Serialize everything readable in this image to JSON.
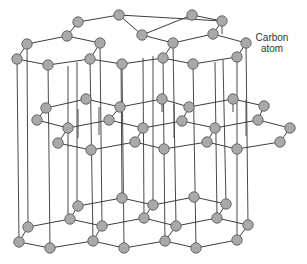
{
  "diagram": {
    "label": {
      "line1": "Carbon",
      "line2": "atom"
    },
    "colors": {
      "atom_fill": "#a9a9a9",
      "atom_stroke": "#5e5e5e",
      "bond": "#3d3d3d",
      "background": "#ffffff"
    },
    "atom_radius": 5.2,
    "layers": [
      {
        "name": "top",
        "atoms": [
          [
            78,
            22
          ],
          [
            119,
            15
          ],
          [
            192,
            15
          ],
          [
            222,
            21
          ],
          [
            67,
            36
          ],
          [
            142,
            35
          ],
          [
            213,
            34
          ],
          [
            27,
            44
          ],
          [
            100,
            43
          ],
          [
            173,
            43
          ],
          [
            246,
            43
          ],
          [
            17,
            59
          ],
          [
            48,
            65
          ],
          [
            90,
            59
          ],
          [
            122,
            64
          ],
          [
            163,
            58
          ],
          [
            193,
            64
          ],
          [
            237,
            57
          ]
        ],
        "bonds": [
          [
            0,
            1
          ],
          [
            1,
            3
          ],
          [
            1,
            5
          ],
          [
            0,
            4
          ],
          [
            2,
            3
          ],
          [
            2,
            5
          ],
          [
            3,
            6
          ],
          [
            4,
            7
          ],
          [
            4,
            8
          ],
          [
            5,
            9
          ],
          [
            6,
            9
          ],
          [
            6,
            10
          ],
          [
            7,
            11
          ],
          [
            11,
            12
          ],
          [
            12,
            13
          ],
          [
            8,
            13
          ],
          [
            13,
            14
          ],
          [
            14,
            15
          ],
          [
            9,
            15
          ],
          [
            15,
            16
          ],
          [
            16,
            17
          ],
          [
            10,
            17
          ]
        ]
      },
      {
        "name": "middle",
        "atoms": [
          [
            86,
            99
          ],
          [
            46,
            108
          ],
          [
            120,
            107
          ],
          [
            162,
            99
          ],
          [
            37,
            120
          ],
          [
            109,
            120
          ],
          [
            68,
            128
          ],
          [
            143,
            128
          ],
          [
            58,
            143
          ],
          [
            135,
            142
          ],
          [
            91,
            150
          ],
          [
            164,
            149
          ],
          [
            189,
            107
          ],
          [
            233,
            99
          ],
          [
            264,
            106
          ],
          [
            182,
            121
          ],
          [
            258,
            120
          ],
          [
            215,
            128
          ],
          [
            290,
            128
          ],
          [
            207,
            142
          ],
          [
            280,
            142
          ],
          [
            237,
            149
          ]
        ],
        "bonds": [
          [
            0,
            1
          ],
          [
            0,
            2
          ],
          [
            2,
            3
          ],
          [
            1,
            4
          ],
          [
            4,
            6
          ],
          [
            2,
            5
          ],
          [
            5,
            6
          ],
          [
            5,
            7
          ],
          [
            3,
            12
          ],
          [
            7,
            9
          ],
          [
            6,
            8
          ],
          [
            8,
            10
          ],
          [
            9,
            10
          ],
          [
            9,
            11
          ],
          [
            12,
            13
          ],
          [
            13,
            14
          ],
          [
            12,
            15
          ],
          [
            15,
            17
          ],
          [
            7,
            15
          ],
          [
            14,
            16
          ],
          [
            16,
            17
          ],
          [
            16,
            18
          ],
          [
            17,
            19
          ],
          [
            18,
            20
          ],
          [
            19,
            11
          ],
          [
            19,
            21
          ],
          [
            20,
            21
          ]
        ]
      },
      {
        "name": "bottom",
        "atoms": [
          [
            122,
            198
          ],
          [
            78,
            206
          ],
          [
            153,
            205
          ],
          [
            70,
            219
          ],
          [
            144,
            218
          ],
          [
            28,
            227
          ],
          [
            102,
            226
          ],
          [
            19,
            242
          ],
          [
            93,
            241
          ],
          [
            50,
            248
          ],
          [
            124,
            248
          ],
          [
            194,
            197
          ],
          [
            226,
            204
          ],
          [
            217,
            218
          ],
          [
            176,
            226
          ],
          [
            248,
            225
          ],
          [
            165,
            241
          ],
          [
            237,
            240
          ],
          [
            196,
            248
          ]
        ],
        "bonds": [
          [
            0,
            1
          ],
          [
            0,
            2
          ],
          [
            1,
            3
          ],
          [
            2,
            4
          ],
          [
            3,
            5
          ],
          [
            3,
            6
          ],
          [
            4,
            6
          ],
          [
            5,
            7
          ],
          [
            7,
            9
          ],
          [
            9,
            8
          ],
          [
            6,
            8
          ],
          [
            8,
            10
          ],
          [
            10,
            16
          ],
          [
            2,
            11
          ],
          [
            11,
            12
          ],
          [
            12,
            13
          ],
          [
            13,
            14
          ],
          [
            4,
            14
          ],
          [
            13,
            15
          ],
          [
            14,
            16
          ],
          [
            16,
            18
          ],
          [
            18,
            17
          ],
          [
            15,
            17
          ]
        ]
      }
    ],
    "vertical_lines": [
      [
        17,
        59,
        19,
        242
      ],
      [
        27,
        44,
        28,
        227
      ],
      [
        48,
        65,
        50,
        248
      ],
      [
        68,
        66,
        68,
        219
      ],
      [
        77,
        62,
        77,
        210
      ],
      [
        90,
        59,
        93,
        241
      ],
      [
        100,
        43,
        102,
        226
      ],
      [
        122,
        64,
        124,
        248
      ],
      [
        121,
        60,
        122,
        198
      ],
      [
        143,
        58,
        144,
        218
      ],
      [
        153,
        56,
        153,
        205
      ],
      [
        163,
        58,
        165,
        241
      ],
      [
        173,
        43,
        176,
        226
      ],
      [
        193,
        64,
        196,
        248
      ],
      [
        215,
        62,
        217,
        218
      ],
      [
        223,
        60,
        226,
        204
      ],
      [
        237,
        57,
        237,
        240
      ],
      [
        246,
        43,
        248,
        225
      ],
      [
        222,
        21,
        222,
        34
      ],
      [
        78,
        109,
        78,
        138
      ],
      [
        99,
        107,
        99,
        135
      ],
      [
        162,
        99,
        162,
        112
      ],
      [
        174,
        104,
        174,
        138
      ],
      [
        246,
        99,
        246,
        136
      ],
      [
        233,
        99,
        233,
        112
      ]
    ]
  }
}
